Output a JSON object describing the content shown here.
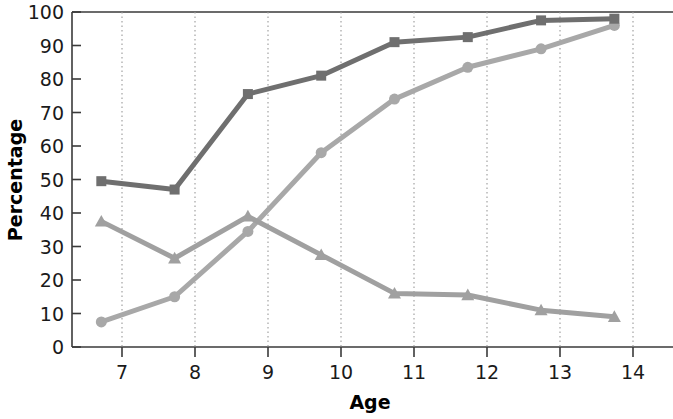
{
  "chart_data": {
    "type": "line",
    "title": "",
    "xlabel": "Age",
    "ylabel": "Percentage",
    "x": [
      7,
      8,
      9,
      10,
      11,
      12,
      13,
      14
    ],
    "xtick_labels": [
      "7",
      "8",
      "9",
      "10",
      "11",
      "12",
      "13",
      "14"
    ],
    "ytick_labels": [
      "0",
      "10",
      "20",
      "30",
      "40",
      "50",
      "60",
      "70",
      "80",
      "90",
      "100"
    ],
    "yticks": [
      0,
      10,
      20,
      30,
      40,
      50,
      60,
      70,
      80,
      90,
      100
    ],
    "xlim": [
      6.6,
      14.8
    ],
    "ylim": [
      0,
      100
    ],
    "grid": "vertical-dotted",
    "legend": "none",
    "series": [
      {
        "name": "series-dark-square",
        "marker": "square",
        "color": "#6f6f6f",
        "values": [
          49.5,
          47.0,
          75.5,
          81.0,
          91.0,
          92.5,
          97.5,
          98.0
        ]
      },
      {
        "name": "series-light-circle",
        "marker": "circle",
        "color": "#a8a8a8",
        "values": [
          7.5,
          15.0,
          34.5,
          58.0,
          74.0,
          83.5,
          89.0,
          96.0
        ]
      },
      {
        "name": "series-mid-triangle",
        "marker": "triangle",
        "color": "#a0a0a0",
        "values": [
          37.5,
          26.5,
          39.0,
          27.5,
          16.0,
          15.5,
          11.0,
          9.0
        ]
      }
    ]
  },
  "axes": {
    "y_label": "Percentage",
    "x_label": "Age"
  }
}
